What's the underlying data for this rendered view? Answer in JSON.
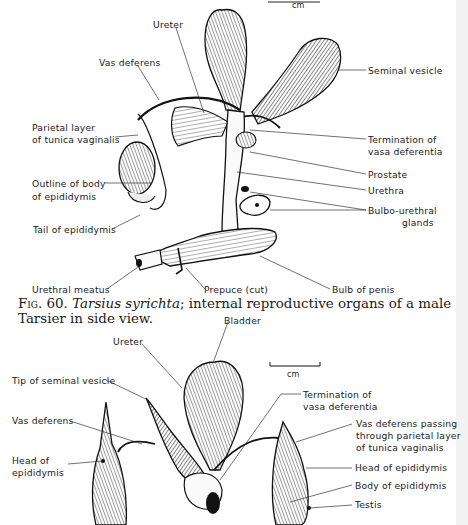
{
  "figure_top": {
    "scale_bar_unit": "cm",
    "labels": {
      "ureter": "Ureter",
      "vas_deferens": "Vas deferens",
      "seminal_vesicle": "Seminal vesicle",
      "parietal_layer_line1": "Parietal layer",
      "parietal_layer_line2": "of tunica vaginalis",
      "termination_line1": "Termination of",
      "termination_line2": "vasa deferentia",
      "outline_body_line1": "Outline of body",
      "outline_body_line2": "of epididymis",
      "prostate": "Prostate",
      "urethra": "Urethra",
      "bulbo_line1": "Bulbo-urethral",
      "bulbo_line2": "glands",
      "tail_epididymis": "Tail of epididymis",
      "urethral_meatus": "Urethral meatus",
      "prepuce": "Prepuce (cut)",
      "bulb_penis": "Bulb of penis"
    }
  },
  "caption": {
    "fig_number": "Fig. 60.",
    "species": "Tarsius syrichta",
    "text": "; internal reproductive organs of a male Tarsier in side view."
  },
  "figure_bottom": {
    "scale_bar_unit": "cm",
    "labels": {
      "bladder": "Bladder",
      "ureter": "Ureter",
      "tip_seminal": "Tip of seminal vesicle",
      "termination_line1": "Termination of",
      "termination_line2": "vasa deferentia",
      "vas_deferens": "Vas deferens",
      "vas_passing_line1": "Vas deferens passing",
      "vas_passing_line2": "through parietal layer",
      "vas_passing_line3": "of tunica vaginalis",
      "head_epi_left_line1": "Head of",
      "head_epi_left_line2": "epididymis",
      "head_epi_right": "Head of epididymis",
      "body_epi": "Body of epididymis",
      "testis": "Testis"
    }
  }
}
